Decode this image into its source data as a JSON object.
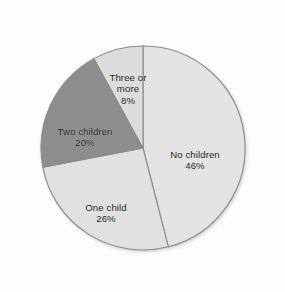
{
  "chart_data": {
    "type": "pie",
    "title": "",
    "subtitle": "",
    "xlabel": "",
    "ylabel": "",
    "legend_position": "none",
    "grid": false,
    "labels_inside": true,
    "start_angle_deg": 0,
    "direction": "clockwise",
    "categories": [
      "No children",
      "One child",
      "Two children",
      "Three or more"
    ],
    "values": [
      46,
      26,
      20,
      8
    ],
    "value_suffix": "%",
    "slices": [
      {
        "label": "No children",
        "value": 46,
        "value_label": "46%",
        "color": "#e3e3e3",
        "start_deg": 0,
        "end_deg": 165.6
      },
      {
        "label": "One child",
        "value": 26,
        "value_label": "26%",
        "color": "#e0e0e0",
        "start_deg": 165.6,
        "end_deg": 259.2
      },
      {
        "label": "Two children",
        "value": 20,
        "value_label": "20%",
        "color": "#8d8d8d",
        "start_deg": 259.2,
        "end_deg": 331.2
      },
      {
        "label": "Three or more",
        "value": 8,
        "value_label": "8%",
        "color": "#dcdcdc",
        "start_deg": 331.2,
        "end_deg": 360
      }
    ]
  },
  "labels": {
    "no_children": {
      "name": "No children",
      "value": "46%"
    },
    "one_child": {
      "name": "One child",
      "value": "26%"
    },
    "two_children": {
      "name": "Two children",
      "value": "20%"
    },
    "three_or_more": {
      "name": "Three or\nmore",
      "value": "8%"
    }
  },
  "style": {
    "background": "#fdfdfd",
    "outline_color": "#8a8a8a",
    "text_color": "#1b1b1b"
  },
  "geometry": {
    "center_x": 143,
    "center_y": 148,
    "radius": 102
  }
}
